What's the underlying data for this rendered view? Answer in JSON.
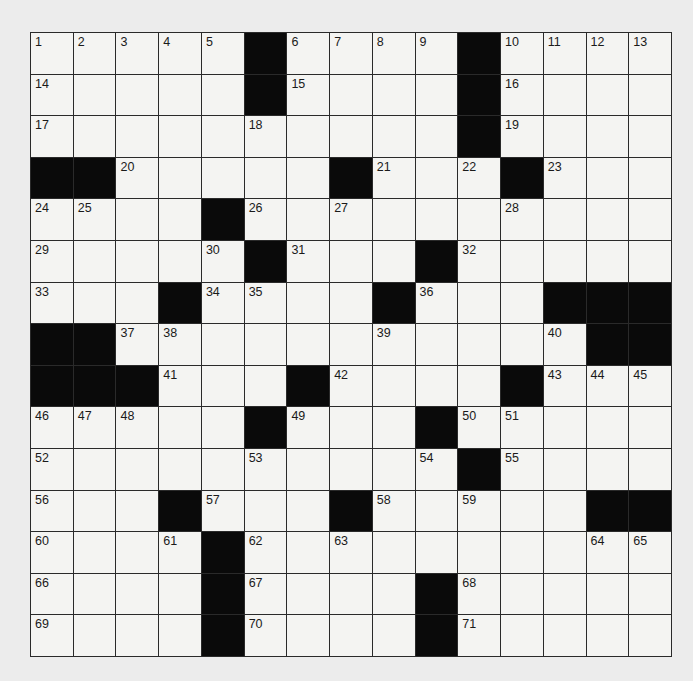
{
  "puzzle": {
    "rows": 15,
    "cols": 15,
    "layout": [
      "1,2,3,4,5,#,6,7,8,9,#,10,11,12,13",
      "14,.,.,.,.,#,15,.,.,.,#,16,.,.,.",
      "17,.,.,.,.,18,.,.,.,.,#,19,.,.,.",
      "#,#,20,.,.,.,.,#,21,.,22,#,23,.,.",
      "24,25,.,.,#,26,.,27,.,.,.,28,.,.,.",
      "29,.,.,.,30,#,31,.,.,#,32,.,.,.,.",
      "33,.,.,#,34,35,.,.,#,36,.,.,#,#,#",
      "#,#,37,38,.,.,.,.,39,.,.,.,40,#,#",
      "#,#,#,41,.,.,#,42,.,.,.,#,43,44,45",
      "46,47,48,.,.,#,49,.,.,#,50,51,.,.,.",
      "52,.,.,.,.,53,.,.,.,54,#,55,.,.,.",
      "56,.,.,#,57,.,.,#,58,.,59,.,.,#,#",
      "60,.,.,61,#,62,.,63,.,.,.,.,.,64,65",
      "66,.,.,.,#,67,.,.,.,#,68,.,.,.,.",
      "69,.,.,.,#,70,.,.,.,#,71,.,.,.,."
    ],
    "colors": {
      "block": "#0a0a0a",
      "cell": "#f4f4f2",
      "line": "#2a2a2a",
      "paper": "#ececec"
    }
  }
}
